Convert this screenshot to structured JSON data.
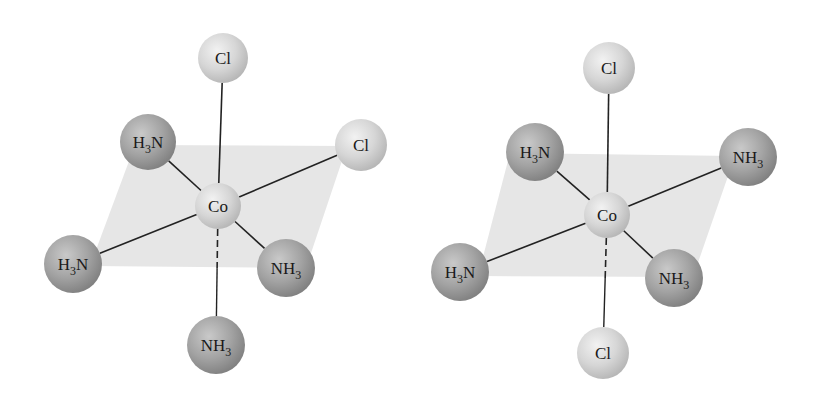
{
  "colors": {
    "plane": "#e6e6e6",
    "bond": "#222222",
    "ligand_dark": "#9a9a9a",
    "ligand_light": "#d0d0d0",
    "background": "#ffffff"
  },
  "molecules": [
    {
      "name": "left-complex",
      "center": {
        "label": "Co",
        "x": 218,
        "y": 206,
        "r": 23
      },
      "plane": "135,145 347,146 306,268 90,266",
      "ligands": [
        {
          "id": "cl-top",
          "base": "Cl",
          "sub": "",
          "pre": "",
          "x": 223,
          "y": 58,
          "r": 25,
          "kind": "light",
          "bond": "solid"
        },
        {
          "id": "h3n-upper-left",
          "base": "H",
          "sub": "3",
          "after": "N",
          "x": 148,
          "y": 142,
          "r": 28,
          "kind": "dark",
          "bond": "solid"
        },
        {
          "id": "cl-right",
          "base": "Cl",
          "sub": "",
          "x": 361,
          "y": 145,
          "r": 26,
          "kind": "light",
          "bond": "solid"
        },
        {
          "id": "h3n-lower-left",
          "base": "H",
          "sub": "3",
          "after": "N",
          "x": 73,
          "y": 264,
          "r": 29,
          "kind": "dark",
          "bond": "solid"
        },
        {
          "id": "nh3-lower-right",
          "base": "NH",
          "sub": "3",
          "after": "",
          "x": 286,
          "y": 268,
          "r": 29,
          "kind": "dark",
          "bond": "solid"
        },
        {
          "id": "nh3-bottom",
          "base": "NH",
          "sub": "3",
          "after": "",
          "x": 216,
          "y": 345,
          "r": 29,
          "kind": "dark",
          "bond": "dashed"
        }
      ]
    },
    {
      "name": "right-complex",
      "center": {
        "label": "Co",
        "x": 607,
        "y": 215,
        "r": 23
      },
      "plane": "510,153 735,156 693,277 478,276",
      "ligands": [
        {
          "id": "cl-top",
          "base": "Cl",
          "sub": "",
          "x": 609,
          "y": 68,
          "r": 26,
          "kind": "light",
          "bond": "solid"
        },
        {
          "id": "h3n-upper-left",
          "base": "H",
          "sub": "3",
          "after": "N",
          "x": 535,
          "y": 152,
          "r": 29,
          "kind": "dark",
          "bond": "solid"
        },
        {
          "id": "nh3-right",
          "base": "NH",
          "sub": "3",
          "after": "",
          "x": 748,
          "y": 157,
          "r": 29,
          "kind": "dark",
          "bond": "solid"
        },
        {
          "id": "h3n-lower-left",
          "base": "H",
          "sub": "3",
          "after": "N",
          "x": 460,
          "y": 272,
          "r": 29,
          "kind": "dark",
          "bond": "solid"
        },
        {
          "id": "nh3-lower-right",
          "base": "NH",
          "sub": "3",
          "after": "",
          "x": 674,
          "y": 278,
          "r": 29,
          "kind": "dark",
          "bond": "solid"
        },
        {
          "id": "cl-bottom",
          "base": "Cl",
          "sub": "",
          "x": 603,
          "y": 353,
          "r": 26,
          "kind": "light",
          "bond": "dashed"
        }
      ]
    }
  ]
}
